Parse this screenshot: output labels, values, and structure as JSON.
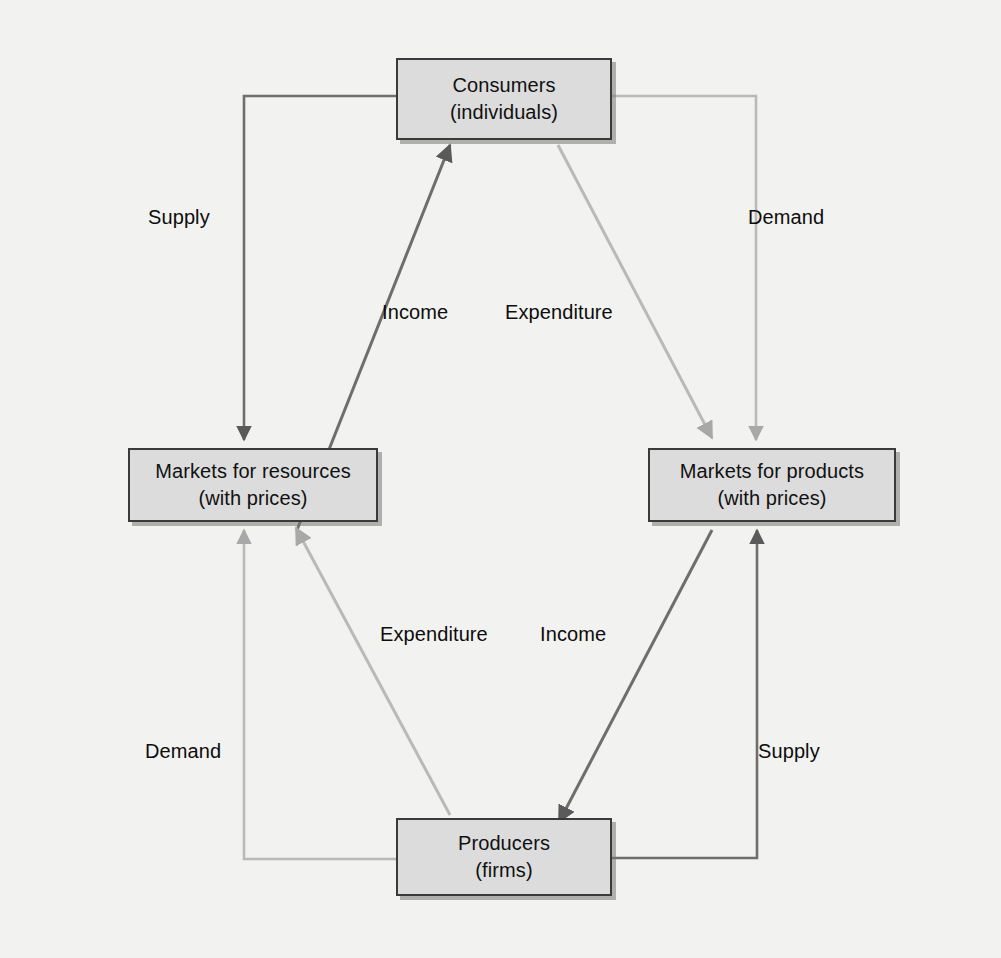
{
  "diagram": {
    "type": "circular-flow",
    "background_color": "#f2f2f0",
    "box_fill_color": "#dcdcdc",
    "box_border_color": "#3a3a3a",
    "line_color_dark": "#6e6e6e",
    "line_color_light": "#b9b9b9",
    "nodes": [
      {
        "id": "consumers",
        "line1": "Consumers",
        "line2": "(individuals)"
      },
      {
        "id": "resources",
        "line1": "Markets for resources",
        "line2": "(with prices)"
      },
      {
        "id": "products",
        "line1": "Markets for products",
        "line2": "(with prices)"
      },
      {
        "id": "producers",
        "line1": "Producers",
        "line2": "(firms)"
      }
    ],
    "flow_labels": [
      {
        "id": "supply-left",
        "text": "Supply"
      },
      {
        "id": "demand-right",
        "text": "Demand"
      },
      {
        "id": "income-top",
        "text": "Income"
      },
      {
        "id": "expenditure-top",
        "text": "Expenditure"
      },
      {
        "id": "expenditure-bottom",
        "text": "Expenditure"
      },
      {
        "id": "income-bottom",
        "text": "Income"
      },
      {
        "id": "demand-left",
        "text": "Demand"
      },
      {
        "id": "supply-right",
        "text": "Supply"
      }
    ]
  }
}
